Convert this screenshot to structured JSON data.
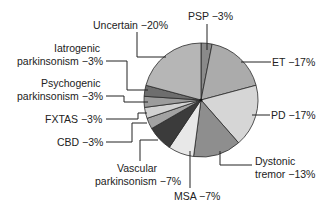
{
  "chart_data": {
    "type": "pie",
    "title": "",
    "start_angle_deg": 0,
    "direction": "clockwise",
    "center": [
      201,
      100
    ],
    "radius": 57,
    "slices": [
      {
        "label": "PSP",
        "value": 3,
        "text": "PSP −3%",
        "color": "#8a8a8a"
      },
      {
        "label": "ET",
        "value": 17,
        "text": "ET −17%",
        "color": "#ababab"
      },
      {
        "label": "PD",
        "value": 17,
        "text": "PD −17%",
        "color": "#d6d6d6"
      },
      {
        "label": "Dystonic tremor",
        "value": 13,
        "text": [
          "Dystonic",
          "tremor −13%"
        ],
        "color": "#8e8e8e"
      },
      {
        "label": "MSA",
        "value": 7,
        "text": "MSA −7%",
        "color": "#e8e8e8"
      },
      {
        "label": "Vascular parkinsonism",
        "value": 7,
        "text": [
          "Vascular",
          "parkinsonism −7%"
        ],
        "color": "#3b3b3b"
      },
      {
        "label": "CBD",
        "value": 3,
        "text": "CBD −3%",
        "color": "#a2a2a2"
      },
      {
        "label": "FXTAS",
        "value": 3,
        "text": "FXTAS −3%",
        "color": "#d2d2d2"
      },
      {
        "label": "Psychogenic parkinsonism",
        "value": 3,
        "text": [
          "Psychogenic",
          "parkinsonism −3%"
        ],
        "color": "#9c9c9c"
      },
      {
        "label": "Iatrogenic parkinsonism",
        "value": 3,
        "text": [
          "Iatrogenic",
          "parkinsonism −3%"
        ],
        "color": "#6e6e6e"
      },
      {
        "label": "Uncertain",
        "value": 20,
        "text": "Uncertain −20%",
        "color": "#b6b6b6"
      }
    ],
    "legend": "none (leader-line labels)",
    "unit": "%"
  },
  "labels": {
    "psp": "PSP −3%",
    "et": "ET −17%",
    "pd": "PD −17%",
    "dystonic_1": "Dystonic",
    "dystonic_2": "tremor −13%",
    "msa": "MSA −7%",
    "vascular_1": "Vascular",
    "vascular_2": "parkinsonism −7%",
    "cbd": "CBD −3%",
    "fxtas": "FXTAS −3%",
    "psychogenic_1": "Psychogenic",
    "psychogenic_2": "parkinsonism −3%",
    "iatrogenic_1": "Iatrogenic",
    "iatrogenic_2": "parkinsonism −3%",
    "uncertain": "Uncertain −20%"
  }
}
